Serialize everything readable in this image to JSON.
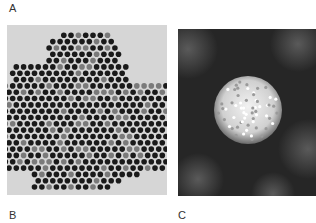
{
  "figure": {
    "labels": {
      "a": "A",
      "b": "B",
      "c": "C"
    },
    "panel_a": {
      "description": "hexagonal array of dark nanoparticles on light background",
      "background": "#d6d6d6",
      "dot_color": "#1a1a1a",
      "dot_faint_color": "#7a7a7a",
      "spacing": 7.3,
      "radius": 2.8
    },
    "panel_c": {
      "description": "single bright spherical particle on dark background",
      "background": "#262626",
      "particle_color": "#e8e8e8",
      "particle_center": [
        70,
        81
      ],
      "particle_radius": 34
    }
  }
}
